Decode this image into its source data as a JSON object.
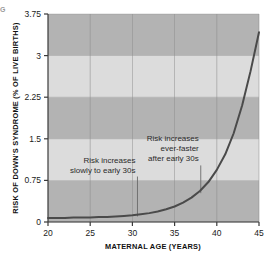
{
  "figure": {
    "edge_artifact": "G",
    "background_color": "#ffffff"
  },
  "chart_data": {
    "type": "line",
    "title": "",
    "xlabel": "MATERNAL AGE (YEARS)",
    "ylabel": "RISK OF DOWN'S SYNDROME (% OF LIVE BIRTHS)",
    "xlim": [
      20,
      45
    ],
    "ylim": [
      0,
      3.75
    ],
    "xticks": [
      20,
      25,
      30,
      35,
      40,
      45
    ],
    "xtick_labels": [
      "20",
      "25",
      "30",
      "35",
      "40",
      "45"
    ],
    "yticks": [
      0,
      0.75,
      1.5,
      2.25,
      3,
      3.75
    ],
    "ytick_labels": [
      "0",
      "0.75",
      "1.5",
      "2.25",
      "3",
      "3.75"
    ],
    "grid": true,
    "legend": "none",
    "line_color": "#4a4a4a",
    "band_color_dark": "#b3b3b3",
    "band_color_light": "#dcdcdc",
    "gridline_color": "#8c8c8c",
    "bands": [
      {
        "from": 0,
        "to": 0.75,
        "shade": "dark"
      },
      {
        "from": 0.75,
        "to": 1.5,
        "shade": "light"
      },
      {
        "from": 1.5,
        "to": 2.25,
        "shade": "dark"
      },
      {
        "from": 2.25,
        "to": 3,
        "shade": "light"
      },
      {
        "from": 3,
        "to": 3.75,
        "shade": "dark"
      }
    ],
    "x": [
      20,
      21,
      22,
      23,
      24,
      25,
      26,
      27,
      28,
      29,
      30,
      31,
      32,
      33,
      34,
      35,
      36,
      37,
      38,
      39,
      40,
      41,
      42,
      43,
      44,
      45
    ],
    "y": [
      0.07,
      0.07,
      0.07,
      0.08,
      0.08,
      0.08,
      0.09,
      0.09,
      0.1,
      0.11,
      0.12,
      0.14,
      0.16,
      0.19,
      0.23,
      0.28,
      0.35,
      0.44,
      0.56,
      0.72,
      0.94,
      1.22,
      1.6,
      2.1,
      2.72,
      3.42
    ],
    "annotations": [
      {
        "id": "slow-rise",
        "lines": [
          "Risk increases",
          "slowly to early 30s"
        ],
        "anchor_x": 30.6,
        "leader_from_y": 0.82,
        "leader_to_y": 0.1
      },
      {
        "id": "fast-rise",
        "lines": [
          "Risk increases",
          "ever-faster",
          "after early 30s"
        ],
        "anchor_x": 38.1,
        "leader_from_y": 1.02,
        "leader_to_y": 0.52
      }
    ]
  }
}
